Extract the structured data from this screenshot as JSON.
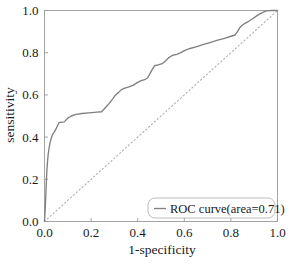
{
  "chart_data": {
    "type": "line",
    "title": "",
    "xlabel": "1-specificity",
    "ylabel": "sensitivity",
    "xlim": [
      0.0,
      1.0
    ],
    "ylim": [
      0.0,
      1.0
    ],
    "grid": false,
    "xticks": [
      "0.0",
      "0.2",
      "0.4",
      "0.6",
      "0.8",
      "1.0"
    ],
    "yticks": [
      "0.0",
      "0.2",
      "0.4",
      "0.6",
      "0.8",
      "1.0"
    ],
    "xtick_values": [
      0.0,
      0.2,
      0.4,
      0.6,
      0.8,
      1.0
    ],
    "ytick_values": [
      0.0,
      0.2,
      0.4,
      0.6,
      0.8,
      1.0
    ],
    "legend_position": "lower right",
    "legend": [
      {
        "label": "ROC curve(area=0.71)",
        "color": "#808080",
        "style": "solid"
      }
    ],
    "auc": 0.71,
    "series": [
      {
        "name": "ROC curve(area=0.71)",
        "style": "solid",
        "color": "#808080",
        "points": [
          [
            0.0,
            0.0
          ],
          [
            0.003,
            0.06
          ],
          [
            0.006,
            0.135
          ],
          [
            0.008,
            0.19
          ],
          [
            0.01,
            0.24
          ],
          [
            0.013,
            0.285
          ],
          [
            0.016,
            0.32
          ],
          [
            0.02,
            0.35
          ],
          [
            0.024,
            0.375
          ],
          [
            0.029,
            0.395
          ],
          [
            0.034,
            0.41
          ],
          [
            0.04,
            0.42
          ],
          [
            0.044,
            0.428
          ],
          [
            0.05,
            0.44
          ],
          [
            0.056,
            0.455
          ],
          [
            0.062,
            0.468
          ],
          [
            0.068,
            0.47
          ],
          [
            0.085,
            0.472
          ],
          [
            0.1,
            0.49
          ],
          [
            0.115,
            0.5
          ],
          [
            0.135,
            0.508
          ],
          [
            0.16,
            0.512
          ],
          [
            0.19,
            0.515
          ],
          [
            0.225,
            0.518
          ],
          [
            0.245,
            0.52
          ],
          [
            0.262,
            0.54
          ],
          [
            0.278,
            0.56
          ],
          [
            0.292,
            0.58
          ],
          [
            0.305,
            0.6
          ],
          [
            0.318,
            0.612
          ],
          [
            0.33,
            0.625
          ],
          [
            0.345,
            0.632
          ],
          [
            0.362,
            0.638
          ],
          [
            0.38,
            0.645
          ],
          [
            0.398,
            0.658
          ],
          [
            0.415,
            0.668
          ],
          [
            0.43,
            0.672
          ],
          [
            0.442,
            0.68
          ],
          [
            0.452,
            0.7
          ],
          [
            0.462,
            0.72
          ],
          [
            0.472,
            0.738
          ],
          [
            0.488,
            0.742
          ],
          [
            0.505,
            0.748
          ],
          [
            0.52,
            0.762
          ],
          [
            0.535,
            0.778
          ],
          [
            0.55,
            0.788
          ],
          [
            0.568,
            0.792
          ],
          [
            0.585,
            0.8
          ],
          [
            0.605,
            0.812
          ],
          [
            0.625,
            0.82
          ],
          [
            0.65,
            0.828
          ],
          [
            0.68,
            0.838
          ],
          [
            0.71,
            0.848
          ],
          [
            0.74,
            0.858
          ],
          [
            0.772,
            0.868
          ],
          [
            0.8,
            0.878
          ],
          [
            0.818,
            0.884
          ],
          [
            0.828,
            0.9
          ],
          [
            0.838,
            0.918
          ],
          [
            0.848,
            0.93
          ],
          [
            0.862,
            0.94
          ],
          [
            0.878,
            0.95
          ],
          [
            0.895,
            0.962
          ],
          [
            0.915,
            0.978
          ],
          [
            0.935,
            0.99
          ],
          [
            0.952,
            0.998
          ],
          [
            0.975,
            1.0
          ],
          [
            1.0,
            1.0
          ]
        ]
      },
      {
        "name": "chance-diagonal",
        "style": "dotted",
        "color": "#b0b0b0",
        "points": [
          [
            0.0,
            0.0
          ],
          [
            1.0,
            1.0
          ]
        ]
      }
    ]
  }
}
